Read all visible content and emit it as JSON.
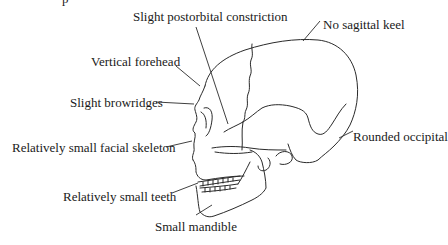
{
  "figure": {
    "type": "labeled anatomical illustration",
    "clipped_heading_fragment": "p",
    "labels": [
      {
        "id": "postorbital",
        "text": "Slight postorbital constriction"
      },
      {
        "id": "sagittal",
        "text": "No sagittal keel"
      },
      {
        "id": "forehead",
        "text": "Vertical forehead"
      },
      {
        "id": "browridges",
        "text": "Slight browridges"
      },
      {
        "id": "facial",
        "text": "Relatively small facial skeleton"
      },
      {
        "id": "occipital",
        "text": "Rounded occipital"
      },
      {
        "id": "teeth",
        "text": "Relatively small teeth"
      },
      {
        "id": "mandible",
        "text": "Small mandible"
      }
    ],
    "colors": {
      "line": "#2a2a2a",
      "text": "#1a1a1a",
      "background": "#ffffff"
    }
  }
}
